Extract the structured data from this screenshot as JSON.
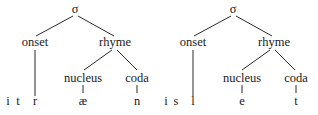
{
  "trees": [
    {
      "syllable": "σ",
      "onset": "onset",
      "rhyme": "rhyme",
      "nucleus": "nucleus",
      "coda": "coda",
      "segments": {
        "extra": [
          "i",
          "t"
        ],
        "onset": "r",
        "nucleus": "æ",
        "coda": "n"
      }
    },
    {
      "syllable": "σ",
      "onset": "onset",
      "rhyme": "rhyme",
      "nucleus": "nucleus",
      "coda": "coda",
      "segments": {
        "extra": [
          "i",
          "s"
        ],
        "onset": "l",
        "nucleus": "e",
        "coda": "t"
      }
    }
  ]
}
